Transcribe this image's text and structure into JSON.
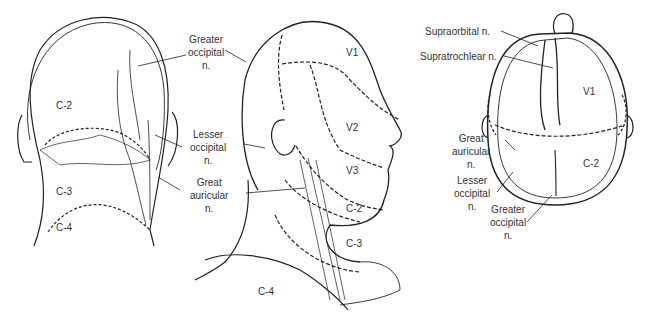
{
  "figure": {
    "posterior_view": {
      "labels": {
        "greater_occipital": [
          "Greater",
          "occipital",
          "n."
        ],
        "lesser_occipital": [
          "Lesser",
          "occipital",
          "n."
        ],
        "great_auricular": [
          "Great",
          "auricular",
          "n."
        ]
      },
      "zones": {
        "c2": "C-2",
        "c3": "C-3",
        "c4": "C-4"
      }
    },
    "lateral_view": {
      "zones": {
        "v1": "V1",
        "v2": "V2",
        "v3": "V3",
        "c2": "C-2",
        "c3": "C-3",
        "c4": "C-4"
      }
    },
    "superior_view": {
      "labels": {
        "supraorbital": "Supraorbital n.",
        "supratrochlear": "Supratrochlear n.",
        "great_auricular": [
          "Great",
          "auricular",
          "n."
        ],
        "lesser_occipital": [
          "Lesser",
          "occipital",
          "n."
        ],
        "greater_occipital": [
          "Greater",
          "occipital",
          "n."
        ]
      },
      "zones": {
        "v1": "V1",
        "c2": "C-2"
      }
    }
  }
}
